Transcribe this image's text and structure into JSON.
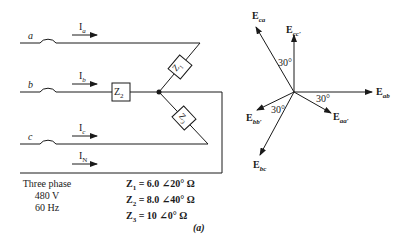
{
  "circuit": {
    "lines": [
      {
        "id": "a",
        "label": "a",
        "current": "I",
        "current_sub": "a"
      },
      {
        "id": "b",
        "label": "b",
        "current": "I",
        "current_sub": "b"
      },
      {
        "id": "c",
        "label": "c",
        "current": "I",
        "current_sub": "c"
      },
      {
        "id": "N",
        "label": "",
        "current": "I",
        "current_sub": "N"
      }
    ],
    "impedances": {
      "z1": {
        "label": "Z",
        "sub": "1"
      },
      "z2": {
        "label": "Z",
        "sub": "2"
      },
      "z3": {
        "label": "Z",
        "sub": "3"
      }
    },
    "source": {
      "line1": "Three phase",
      "line2": "480 V",
      "line3": "60 Hz"
    },
    "values": [
      {
        "name": "Z",
        "sub": "1",
        "value": " = 6.0 ∠20° Ω"
      },
      {
        "name": "Z",
        "sub": "2",
        "value": " = 8.0 ∠40° Ω"
      },
      {
        "name": "Z",
        "sub": "3",
        "value": " = 10 ∠0° Ω"
      }
    ]
  },
  "phasor": {
    "vectors": [
      {
        "id": "Eab",
        "main": "E",
        "sub": "ab",
        "angle_deg": 0
      },
      {
        "id": "Eaa",
        "main": "E",
        "sub": "aa′",
        "angle_deg": -30
      },
      {
        "id": "Ecc",
        "main": "E",
        "sub": "cc′",
        "angle_deg": 90
      },
      {
        "id": "Eca",
        "main": "E",
        "sub": "ca",
        "angle_deg": 120
      },
      {
        "id": "Ebb",
        "main": "E",
        "sub": "bb′",
        "angle_deg": 210
      },
      {
        "id": "Ebc",
        "main": "E",
        "sub": "bc",
        "angle_deg": 240
      }
    ],
    "angle_labels": [
      "30°",
      "30°",
      "30°"
    ]
  },
  "caption": "(a)"
}
